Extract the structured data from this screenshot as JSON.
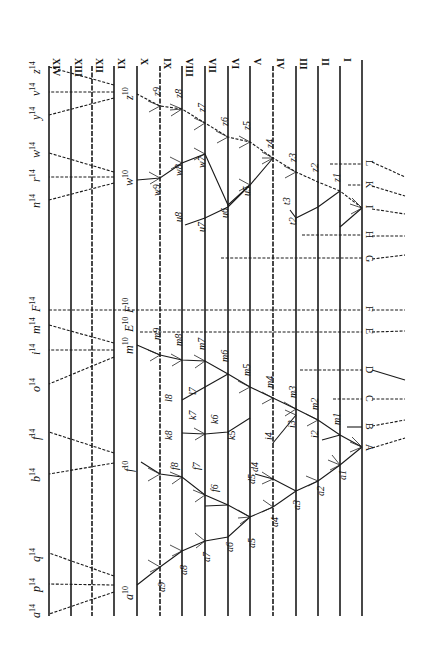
{
  "orientation": "rotated-90-clockwise",
  "generation_lines": {
    "roman_labels": [
      "I",
      "II",
      "III",
      "IV",
      "V",
      "VI",
      "VII",
      "VIII",
      "IX",
      "X",
      "XI",
      "XII",
      "XIII",
      "XIV"
    ],
    "x_positions": [
      340,
      318,
      296,
      273,
      250,
      228,
      205,
      182,
      160,
      137,
      114,
      92,
      71,
      49
    ],
    "base_x": 362,
    "y_top": 60,
    "y_bottom": 615
  },
  "ancestral_species": [
    {
      "label": "A",
      "y": 447
    },
    {
      "label": "B",
      "y": 427
    },
    {
      "label": "C",
      "y": 399
    },
    {
      "label": "D",
      "y": 370
    },
    {
      "label": "E",
      "y": 332
    },
    {
      "label": "F",
      "y": 310
    },
    {
      "label": "G",
      "y": 259
    },
    {
      "label": "H",
      "y": 235
    },
    {
      "label": "I",
      "y": 208
    },
    {
      "label": "K",
      "y": 185
    },
    {
      "label": "L",
      "y": 164
    }
  ],
  "lineages": {
    "a": [
      "a1",
      "a2",
      "a3",
      "a4",
      "a5",
      "a6",
      "a7",
      "a8",
      "a9",
      "a10"
    ],
    "d": [
      "d4",
      "d5"
    ],
    "f": [
      "f6",
      "f7",
      "f8",
      "f",
      "f10"
    ],
    "i": [
      "i2",
      "i3",
      "i4"
    ],
    "k": [
      "k5",
      "k6",
      "k7",
      "k8"
    ],
    "l": [
      "l7",
      "l8"
    ],
    "m": [
      "m1",
      "m2",
      "m3",
      "m4",
      "m5",
      "m6",
      "m7",
      "m8",
      "m9",
      "m10"
    ],
    "E": [
      "E10"
    ],
    "F": [
      "F10"
    ],
    "z": [
      "z1",
      "z2",
      "z3",
      "z4",
      "z5",
      "z6",
      "z7",
      "z8",
      "z9",
      "z10"
    ],
    "u": [
      "t2",
      "t3",
      "u5",
      "u6",
      "u7",
      "u8"
    ],
    "w": [
      "w7",
      "w8",
      "w9",
      "w10"
    ]
  },
  "final_species_level_XIV": [
    {
      "label": "a",
      "sup": "14"
    },
    {
      "label": "p",
      "sup": "14"
    },
    {
      "label": "q",
      "sup": "14"
    },
    {
      "label": "b",
      "sup": "14"
    },
    {
      "label": "f",
      "sup": "14"
    },
    {
      "label": "o",
      "sup": "14"
    },
    {
      "label": "i",
      "sup": "14"
    },
    {
      "label": "m",
      "sup": "14"
    },
    {
      "label": "F",
      "sup": "14"
    },
    {
      "label": "n",
      "sup": "14"
    },
    {
      "label": "r",
      "sup": "14"
    },
    {
      "label": "w",
      "sup": "14"
    },
    {
      "label": "y",
      "sup": "14"
    },
    {
      "label": "v",
      "sup": "14"
    },
    {
      "label": "z",
      "sup": "14"
    }
  ],
  "level_X_labels": [
    {
      "label": "a",
      "sup": "10"
    },
    {
      "label": "f",
      "sup": "10"
    },
    {
      "label": "m",
      "sup": "10"
    },
    {
      "label": "E",
      "sup": "10"
    },
    {
      "label": "F",
      "sup": "10"
    },
    {
      "label": "w",
      "sup": "10"
    },
    {
      "label": "z",
      "sup": "10"
    }
  ]
}
